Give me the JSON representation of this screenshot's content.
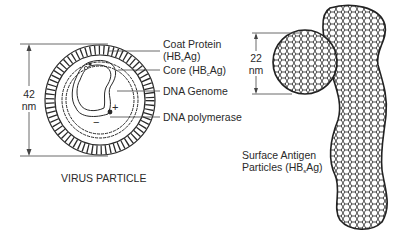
{
  "diagram": {
    "virus_particle": {
      "title": "VIRUS PARTICLE",
      "dimension": {
        "value": "42",
        "unit": "nm"
      },
      "labels": [
        {
          "line1": "Coat Protein",
          "line2_pre": "(HB",
          "line2_sub": "s",
          "line2_post": "Ag)"
        },
        {
          "pre": "Core (HB",
          "sub": "c",
          "post": "Ag)"
        },
        {
          "text": "DNA Genome"
        },
        {
          "text": "DNA polymerase"
        }
      ],
      "strand_signs": {
        "plus": "+",
        "minus": "−"
      }
    },
    "surface_antigen": {
      "dimension": {
        "value": "22",
        "unit": "nm"
      },
      "label_line1": "Surface Antigen",
      "label_line2_pre": "Particles (HB",
      "label_line2_sub": "s",
      "label_line2_post": "Ag)"
    },
    "colors": {
      "line": "#2a2a2a",
      "background": "#ffffff"
    }
  }
}
